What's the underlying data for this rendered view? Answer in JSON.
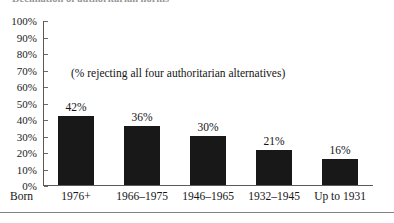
{
  "figure": {
    "title": "Declination of authoritarian norms",
    "row_label": "Born",
    "annotation": "(% rejecting all four authoritarian alternatives)"
  },
  "colors": {
    "bar_fill": "#181818",
    "axis": "#5a5a5a",
    "text": "#141414",
    "rule": "#808080"
  },
  "chart_data": {
    "type": "bar",
    "title": "Declination of authoritarian norms",
    "annotation": "(% rejecting all four authoritarian alternatives)",
    "categories": [
      "1976+",
      "1966–1975",
      "1946–1965",
      "1932–1945",
      "Up to 1931"
    ],
    "values": [
      42,
      36,
      30,
      21,
      16
    ],
    "value_labels": [
      "42%",
      "36%",
      "30%",
      "21%",
      "16%"
    ],
    "xlabel": "Born",
    "ylabel": "",
    "ylim": [
      0,
      100
    ],
    "ytick_values": [
      100,
      90,
      80,
      70,
      60,
      50,
      40,
      30,
      20,
      10,
      0
    ],
    "ytick_labels": [
      "100%",
      "90%",
      "80%",
      "70%",
      "60%",
      "50%",
      "40%",
      "30%",
      "20%",
      "10%",
      "0%"
    ],
    "grid": false,
    "legend": "none",
    "series": [
      {
        "name": "% rejecting all four authoritarian alternatives",
        "values": [
          42,
          36,
          30,
          21,
          16
        ]
      }
    ]
  }
}
